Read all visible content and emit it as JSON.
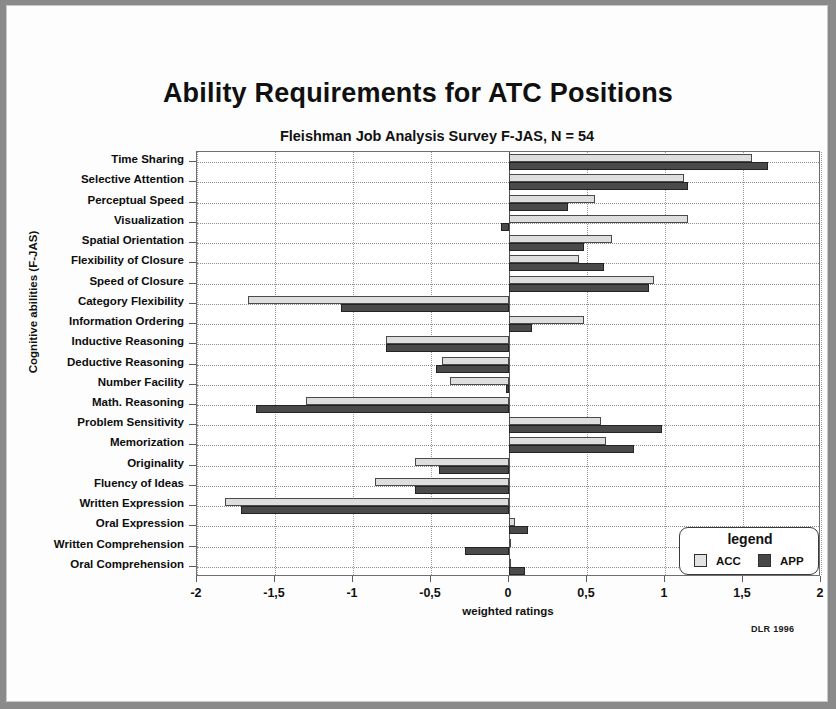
{
  "title": "Ability Requirements for ATC Positions",
  "subtitle": "Fleishman Job Analysis Survey  F-JAS,  N = 54",
  "credit": "DLR 1996",
  "legend": {
    "title": "legend",
    "acc_label": "ACC",
    "app_label": "APP"
  },
  "chart_data": {
    "type": "bar",
    "orientation": "horizontal",
    "title": "Ability Requirements for ATC Positions",
    "subtitle": "Fleishman Job Analysis Survey  F-JAS,  N = 54",
    "xlabel": "weighted ratings",
    "ylabel": "Cognitive abilities (F-JAS)",
    "xlim": [
      -2,
      2
    ],
    "xticks": [
      -2,
      -1.5,
      -1,
      -0.5,
      0,
      0.5,
      1,
      1.5,
      2
    ],
    "xtick_labels": [
      "-2",
      "-1,5",
      "-1",
      "-0,5",
      "0",
      "0,5",
      "1",
      "1,5",
      "2"
    ],
    "grid": true,
    "legend_position": "bottom-right",
    "categories": [
      "Time Sharing",
      "Selective Attention",
      "Perceptual Speed",
      "Visualization",
      "Spatial Orientation",
      "Flexibility of Closure",
      "Speed of Closure",
      "Category Flexibility",
      "Information Ordering",
      "Inductive Reasoning",
      "Deductive Reasoning",
      "Number Facility",
      "Math. Reasoning",
      "Problem Sensitivity",
      "Memorization",
      "Originality",
      "Fluency of Ideas",
      "Written Expression",
      "Oral Expression",
      "Written Comprehension",
      "Oral Comprehension"
    ],
    "series": [
      {
        "name": "ACC",
        "color": "#dededd",
        "values": [
          1.56,
          1.12,
          0.55,
          1.15,
          0.66,
          0.45,
          0.93,
          -1.67,
          0.48,
          -0.79,
          -0.43,
          -0.38,
          -1.3,
          0.59,
          0.62,
          -0.6,
          -0.86,
          -1.82,
          0.04,
          0.0,
          0.0
        ]
      },
      {
        "name": "APP",
        "color": "#4a4a4a",
        "values": [
          1.66,
          1.15,
          0.38,
          -0.05,
          0.48,
          0.61,
          0.9,
          -1.08,
          0.15,
          -0.79,
          -0.47,
          -0.02,
          -1.62,
          0.98,
          0.8,
          -0.45,
          -0.6,
          -1.72,
          0.12,
          -0.28,
          0.1
        ]
      }
    ]
  }
}
